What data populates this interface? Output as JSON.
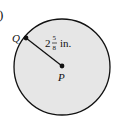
{
  "figure": {
    "part_marker": ")",
    "circle": {
      "fill": "#e6e6e6",
      "stroke": "#111111"
    },
    "points": {
      "edge": {
        "label": "Q"
      },
      "center": {
        "label": "P"
      }
    },
    "radius_label": {
      "whole": "2",
      "numerator": "5",
      "denominator": "8",
      "unit": "in."
    }
  }
}
